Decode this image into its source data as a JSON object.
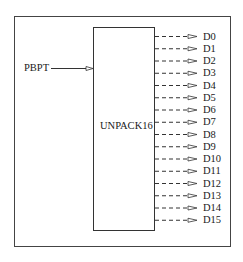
{
  "diagram": {
    "block": {
      "label": "UNPACK16"
    },
    "input": {
      "label": "PBPT"
    },
    "outputs": [
      "D0",
      "D1",
      "D2",
      "D3",
      "D4",
      "D5",
      "D6",
      "D7",
      "D8",
      "D9",
      "D10",
      "D11",
      "D12",
      "D13",
      "D14",
      "D15"
    ]
  },
  "colors": {
    "line": "#333333",
    "background": "#ffffff"
  }
}
